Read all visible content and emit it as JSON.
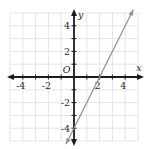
{
  "figure": {
    "x_axis_label": "x",
    "y_axis_label": "y",
    "origin_label": "O"
  },
  "chart_data": {
    "type": "line",
    "title": "",
    "xlabel": "x",
    "ylabel": "y",
    "xlim": [
      -5,
      5
    ],
    "ylim": [
      -5,
      5
    ],
    "grid": true,
    "grid_step": 1,
    "x_tick_labels": [
      -4,
      -2,
      2,
      4
    ],
    "y_tick_labels": [
      4,
      2,
      -2,
      -4
    ],
    "origin_label": "O",
    "series": [
      {
        "name": "graphed-line",
        "equation": "y = 2x - 4",
        "slope": 2,
        "y_intercept": -4,
        "x_intercept": 2,
        "points": [
          [
            0,
            -4
          ],
          [
            1,
            -2
          ],
          [
            2,
            0
          ],
          [
            3,
            2
          ],
          [
            4,
            4
          ]
        ],
        "draw_domain": [
          -0.63,
          4.63
        ],
        "arrows_both_ends": true
      }
    ]
  },
  "colors": {
    "background": "#ffffff",
    "grid": "#e1e5e8",
    "axis": "#1c1c1c",
    "line": "#8f9296",
    "text": "#2a2a2a"
  }
}
